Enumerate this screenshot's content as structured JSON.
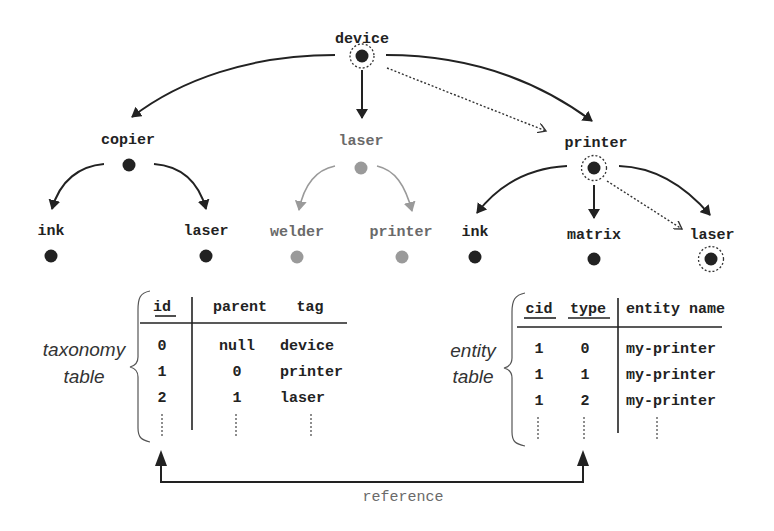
{
  "colors": {
    "ink": "#222222",
    "muted": "#9a9a9a",
    "background": "#ffffff"
  },
  "tree": {
    "root": {
      "label": "device",
      "marked": true
    },
    "children": [
      {
        "label": "copier",
        "children": [
          {
            "label": "ink"
          },
          {
            "label": "laser"
          }
        ]
      },
      {
        "label": "laser",
        "muted": true,
        "children": [
          {
            "label": "welder"
          },
          {
            "label": "printer"
          }
        ]
      },
      {
        "label": "printer",
        "marked": true,
        "children": [
          {
            "label": "ink"
          },
          {
            "label": "matrix"
          },
          {
            "label": "laser",
            "marked": true
          }
        ]
      }
    ]
  },
  "taxonomy_table": {
    "caption_line1": "taxonomy",
    "caption_line2": "table",
    "headers": [
      "id",
      "parent",
      "tag"
    ],
    "rows": [
      [
        "0",
        "null",
        "device"
      ],
      [
        "1",
        "0",
        "printer"
      ],
      [
        "2",
        "1",
        "laser"
      ]
    ],
    "continuation": "⋮"
  },
  "entity_table": {
    "caption_line1": "entity",
    "caption_line2": "table",
    "headers": [
      "cid",
      "type",
      "entity name"
    ],
    "rows": [
      [
        "1",
        "0",
        "my-printer"
      ],
      [
        "1",
        "1",
        "my-printer"
      ],
      [
        "1",
        "2",
        "my-printer"
      ]
    ]
  },
  "reference_label": "reference"
}
